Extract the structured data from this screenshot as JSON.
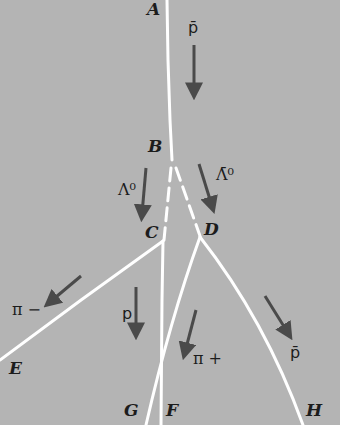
{
  "diagram": {
    "colors": {
      "background": "#b4b4b4",
      "track": "#ffffff",
      "arrow": "#4a4a4a",
      "label": "#1c1c1c"
    },
    "points": {
      "A": "A",
      "B": "B",
      "C": "C",
      "D": "D",
      "E": "E",
      "F": "F",
      "G": "G",
      "H": "H"
    },
    "particles": {
      "antiproton_in": "p̄",
      "lambda0": "Λ⁰",
      "antilambda0": "Λ̄⁰",
      "pi_minus": "π −",
      "proton": "p",
      "pi_plus": "π +",
      "antiproton_out": "p̄"
    },
    "tracks": [
      {
        "id": "AB",
        "from": "A",
        "to": "B",
        "style": "solid",
        "particle": "antiproton"
      },
      {
        "id": "BC",
        "from": "B",
        "to": "C",
        "style": "dashed",
        "particle": "Lambda0 (neutral)"
      },
      {
        "id": "BD",
        "from": "B",
        "to": "D",
        "style": "dashed",
        "particle": "anti-Lambda0 (neutral)"
      },
      {
        "id": "CE",
        "from": "C",
        "to": "E",
        "style": "solid",
        "particle": "pi-"
      },
      {
        "id": "CG",
        "from": "C",
        "to": "G",
        "style": "solid",
        "particle": "proton"
      },
      {
        "id": "DF",
        "from": "D",
        "to": "F",
        "style": "solid",
        "particle": "pi+"
      },
      {
        "id": "DH",
        "from": "D",
        "to": "H",
        "style": "solid",
        "particle": "antiproton"
      }
    ]
  }
}
